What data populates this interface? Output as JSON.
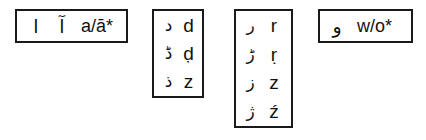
{
  "diagram": {
    "text_color": "#111111",
    "border_color": "#1a1a1a",
    "background_color": "#ffffff",
    "boxes": [
      {
        "id": "box-1",
        "orientation": "horizontal",
        "rows": [
          {
            "scripts": [
              "ا",
              "آ"
            ],
            "latin": "a/ā*"
          }
        ]
      },
      {
        "id": "box-2",
        "orientation": "vertical",
        "rows": [
          {
            "scripts": [
              "د"
            ],
            "latin": "d"
          },
          {
            "scripts": [
              "ڈ"
            ],
            "latin": "ḍ"
          },
          {
            "scripts": [
              "ذ"
            ],
            "latin": "z"
          }
        ]
      },
      {
        "id": "box-3",
        "orientation": "vertical",
        "rows": [
          {
            "scripts": [
              "ر"
            ],
            "latin": "r"
          },
          {
            "scripts": [
              "ڑ"
            ],
            "latin": "ṛ"
          },
          {
            "scripts": [
              "ز"
            ],
            "latin": "z"
          },
          {
            "scripts": [
              "ژ"
            ],
            "latin": "ź"
          }
        ]
      },
      {
        "id": "box-4",
        "orientation": "horizontal",
        "rows": [
          {
            "scripts": [
              "و"
            ],
            "latin": "w/o*"
          }
        ]
      }
    ]
  }
}
